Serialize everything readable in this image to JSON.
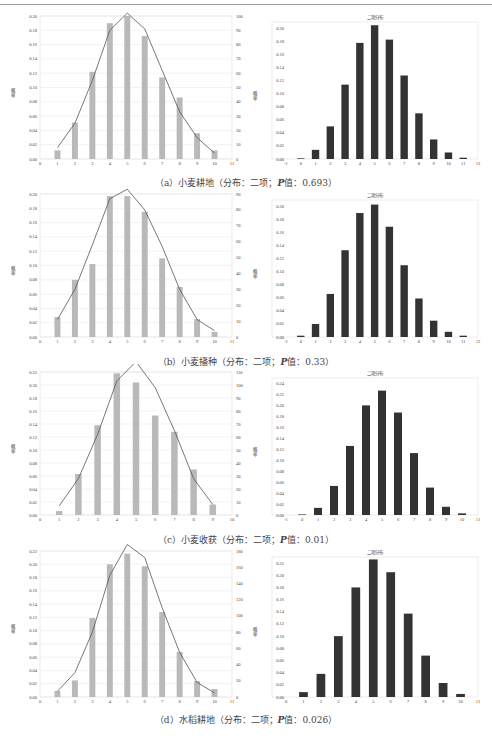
{
  "figures": [
    {
      "id": "a",
      "caption_prefix": "（a）小麦耕地（分布：二项；",
      "p_label": "P",
      "caption_suffix": "值：0.693）",
      "left": {
        "ylabel": "概率",
        "y2label": "频数",
        "xticks": [
          0,
          1,
          2,
          3,
          4,
          5,
          6,
          7,
          8,
          9,
          10,
          11
        ],
        "yticks": [
          "0.00",
          "0.02",
          "0.04",
          "0.06",
          "0.08",
          "0.10",
          "0.12",
          "0.14",
          "0.16",
          "0.18",
          "0.20"
        ],
        "y2ticks": [
          "0",
          "10",
          "20",
          "30",
          "40",
          "50",
          "60",
          "70",
          "80",
          "90",
          "100"
        ]
      },
      "right": {
        "title": "二项分布",
        "ylabel": "概率",
        "xticks": [
          -1,
          0,
          1,
          2,
          3,
          4,
          5,
          6,
          7,
          8,
          9,
          10,
          11,
          12
        ],
        "yticks": [
          "0.00",
          "0.02",
          "0.04",
          "0.06",
          "0.08",
          "0.10",
          "0.12",
          "0.14",
          "0.16",
          "0.18",
          "0.20"
        ]
      }
    },
    {
      "id": "b",
      "caption_prefix": "（b）小麦播种（分布：二项；",
      "p_label": "P",
      "caption_suffix": "值：0.33）",
      "left": {
        "ylabel": "概率",
        "y2label": "频数",
        "xticks": [
          0,
          1,
          2,
          3,
          4,
          5,
          6,
          7,
          8,
          9,
          10,
          11
        ],
        "yticks": [
          "0.00",
          "0.02",
          "0.04",
          "0.06",
          "0.08",
          "0.10",
          "0.12",
          "0.14",
          "0.16",
          "0.18",
          "0.20"
        ],
        "y2ticks": [
          "0",
          "10",
          "20",
          "30",
          "40",
          "50",
          "60",
          "70",
          "80",
          "90"
        ]
      },
      "right": {
        "title": "二项分布",
        "ylabel": "概率",
        "xticks": [
          -1,
          0,
          1,
          2,
          3,
          4,
          5,
          6,
          7,
          8,
          9,
          10,
          11,
          12
        ],
        "yticks": [
          "0.00",
          "0.02",
          "0.04",
          "0.06",
          "0.08",
          "0.10",
          "0.12",
          "0.14",
          "0.16",
          "0.18",
          "0.20"
        ]
      }
    },
    {
      "id": "c",
      "caption_prefix": "（c）小麦收获（分布：二项；",
      "p_label": "P",
      "caption_suffix": "值：0.01）",
      "left": {
        "ylabel": "概率",
        "y2label": "频数",
        "xticks": [
          0,
          1,
          2,
          3,
          4,
          5,
          6,
          7,
          8,
          9,
          10
        ],
        "yticks": [
          "0.00",
          "0.02",
          "0.04",
          "0.06",
          "0.08",
          "0.10",
          "0.12",
          "0.14",
          "0.16",
          "0.18",
          "0.20",
          "0.22"
        ],
        "y2ticks": [
          "0",
          "10",
          "20",
          "30",
          "40",
          "50",
          "60",
          "70",
          "80",
          "90",
          "100",
          "110"
        ]
      },
      "right": {
        "title": "二项分布",
        "ylabel": "概率",
        "xticks": [
          -1,
          0,
          1,
          2,
          3,
          4,
          5,
          6,
          7,
          8,
          9,
          10,
          11
        ],
        "yticks": [
          "0.00",
          "0.02",
          "0.04",
          "0.06",
          "0.08",
          "0.10",
          "0.12",
          "0.14",
          "0.16",
          "0.18",
          "0.20",
          "0.22",
          "0.24"
        ]
      }
    },
    {
      "id": "d",
      "caption_prefix": "（d）水稻耕地（分布：二项；",
      "p_label": "P",
      "caption_suffix": "值：0.026）",
      "left": {
        "ylabel": "概率",
        "y2label": "频数",
        "xticks": [
          0,
          1,
          2,
          3,
          4,
          5,
          6,
          7,
          8,
          9,
          10,
          11
        ],
        "yticks": [
          "0.00",
          "0.02",
          "0.04",
          "0.06",
          "0.08",
          "0.10",
          "0.12",
          "0.14",
          "0.16",
          "0.18",
          "0.20",
          "0.22"
        ],
        "y2ticks": [
          "0",
          "20",
          "40",
          "60",
          "80",
          "100",
          "120",
          "140",
          "160",
          "180"
        ]
      },
      "right": {
        "title": "二项分布",
        "ylabel": "概率",
        "xticks": [
          0,
          1,
          2,
          3,
          4,
          5,
          6,
          7,
          8,
          9,
          10,
          11
        ],
        "yticks": [
          "0.00",
          "0.02",
          "0.04",
          "0.06",
          "0.08",
          "0.10",
          "0.12",
          "0.14",
          "0.16",
          "0.18",
          "0.20",
          "0.22"
        ]
      }
    }
  ],
  "chart_data": [
    {
      "type": "bar",
      "id": "a-observed",
      "title": "",
      "xlabel": "",
      "ylabel": "概率",
      "y2label": "频数",
      "categories": [
        1,
        2,
        3,
        4,
        5,
        6,
        7,
        8,
        9,
        10
      ],
      "series": [
        {
          "name": "probability",
          "kind": "bar",
          "values": [
            0.012,
            0.051,
            0.122,
            0.19,
            0.2,
            0.172,
            0.114,
            0.086,
            0.036,
            0.012
          ]
        },
        {
          "name": "frequency",
          "kind": "line",
          "axis": "y2",
          "values": [
            8,
            25,
            55,
            90,
            102,
            91,
            62,
            33,
            15,
            4
          ]
        }
      ],
      "xlim": [
        0,
        11
      ],
      "ylim": [
        0,
        0.2
      ],
      "y2lim": [
        0,
        100
      ]
    },
    {
      "type": "bar",
      "id": "a-binomial",
      "title": "二项分布",
      "ylabel": "概率",
      "categories": [
        0,
        1,
        2,
        3,
        4,
        5,
        6,
        7,
        8,
        9,
        10,
        11
      ],
      "values": [
        0.001,
        0.014,
        0.05,
        0.114,
        0.178,
        0.205,
        0.183,
        0.128,
        0.07,
        0.03,
        0.01,
        0.002
      ],
      "xlim": [
        -1,
        12
      ],
      "ylim": [
        0,
        0.21
      ]
    },
    {
      "type": "bar",
      "id": "b-observed",
      "title": "",
      "ylabel": "概率",
      "y2label": "频数",
      "categories": [
        1,
        2,
        3,
        4,
        5,
        6,
        7,
        8,
        9,
        10
      ],
      "series": [
        {
          "name": "probability",
          "kind": "bar",
          "values": [
            0.028,
            0.08,
            0.102,
            0.197,
            0.197,
            0.175,
            0.11,
            0.07,
            0.025,
            0.007
          ]
        },
        {
          "name": "frequency",
          "kind": "line",
          "axis": "y2",
          "values": [
            11,
            30,
            58,
            87,
            93,
            80,
            57,
            30,
            11,
            4
          ]
        }
      ],
      "xlim": [
        0,
        11
      ],
      "ylim": [
        0,
        0.2
      ],
      "y2lim": [
        0,
        90
      ]
    },
    {
      "type": "bar",
      "id": "b-binomial",
      "title": "二项分布",
      "ylabel": "概率",
      "categories": [
        0,
        1,
        2,
        3,
        4,
        5,
        6,
        7,
        8,
        9,
        10,
        11
      ],
      "values": [
        0.002,
        0.02,
        0.066,
        0.133,
        0.19,
        0.203,
        0.169,
        0.11,
        0.059,
        0.025,
        0.008,
        0.002
      ],
      "xlim": [
        -1,
        12
      ],
      "ylim": [
        0,
        0.21
      ]
    },
    {
      "type": "bar",
      "id": "c-observed",
      "title": "",
      "ylabel": "概率",
      "y2label": "频数",
      "categories": [
        1,
        2,
        3,
        4,
        5,
        6,
        7,
        8,
        9
      ],
      "series": [
        {
          "name": "probability",
          "kind": "bar",
          "values": [
            0.006,
            0.063,
            0.138,
            0.218,
            0.204,
            0.153,
            0.128,
            0.07,
            0.016
          ]
        },
        {
          "name": "frequency",
          "kind": "line",
          "axis": "y2",
          "values": [
            7,
            28,
            62,
            103,
            118,
            98,
            65,
            28,
            8
          ]
        }
      ],
      "xlim": [
        0,
        10
      ],
      "ylim": [
        0,
        0.22
      ],
      "y2lim": [
        0,
        110
      ]
    },
    {
      "type": "bar",
      "id": "c-binomial",
      "title": "二项分布",
      "ylabel": "概率",
      "categories": [
        0,
        1,
        2,
        3,
        4,
        5,
        6,
        7,
        8,
        9,
        10
      ],
      "values": [
        0.001,
        0.013,
        0.053,
        0.126,
        0.2,
        0.227,
        0.187,
        0.113,
        0.05,
        0.015,
        0.003
      ],
      "xlim": [
        -1,
        11
      ],
      "ylim": [
        0,
        0.24
      ]
    },
    {
      "type": "bar",
      "id": "d-observed",
      "title": "",
      "ylabel": "概率",
      "y2label": "频数",
      "categories": [
        1,
        2,
        3,
        4,
        5,
        6,
        7,
        8,
        9,
        10
      ],
      "series": [
        {
          "name": "probability",
          "kind": "bar",
          "values": [
            0.009,
            0.025,
            0.119,
            0.2,
            0.216,
            0.197,
            0.128,
            0.068,
            0.024,
            0.012
          ]
        },
        {
          "name": "frequency",
          "kind": "line",
          "axis": "y2",
          "values": [
            7,
            30,
            80,
            150,
            188,
            172,
            110,
            55,
            18,
            5
          ]
        }
      ],
      "xlim": [
        0,
        11
      ],
      "ylim": [
        0,
        0.22
      ],
      "y2lim": [
        0,
        180
      ]
    },
    {
      "type": "bar",
      "id": "d-binomial",
      "title": "二项分布",
      "ylabel": "概率",
      "categories": [
        1,
        2,
        3,
        4,
        5,
        6,
        7,
        8,
        9,
        10
      ],
      "values": [
        0.008,
        0.038,
        0.1,
        0.18,
        0.226,
        0.205,
        0.137,
        0.068,
        0.023,
        0.005
      ],
      "xlim": [
        0,
        11
      ],
      "ylim": [
        0,
        0.23
      ]
    }
  ]
}
